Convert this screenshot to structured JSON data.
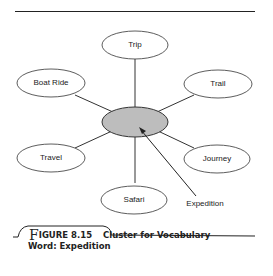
{
  "diagram": {
    "center": {
      "label": "",
      "fill": "#bdbdbd"
    },
    "nodes": [
      {
        "id": "trip",
        "label": "Trip"
      },
      {
        "id": "boat-ride",
        "label": "Boat Ride"
      },
      {
        "id": "trail",
        "label": "Trail"
      },
      {
        "id": "travel",
        "label": "Travel"
      },
      {
        "id": "journey",
        "label": "Journey"
      },
      {
        "id": "safari",
        "label": "Safari"
      }
    ],
    "arrow_label": "Expedition"
  },
  "caption": {
    "first_letter": "F",
    "figure_rest": "IGURE 8.15",
    "title_line1": "Cluster for Vocabulary",
    "title_line2": "Word: Expedition"
  }
}
